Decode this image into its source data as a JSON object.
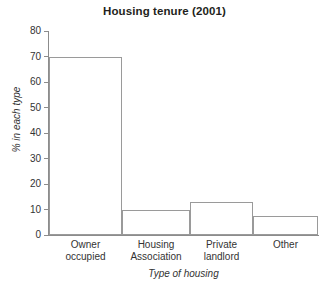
{
  "chart_data": {
    "type": "bar",
    "title": "Housing tenure (2001)",
    "xlabel": "Type of housing",
    "ylabel": "% in each type",
    "categories": [
      "Owner occupied",
      "Housing Association",
      "Private landlord",
      "Other"
    ],
    "category_lines": [
      [
        "Owner",
        "occupied"
      ],
      [
        "Housing",
        "Association"
      ],
      [
        "Private",
        "landlord"
      ],
      [
        "Other"
      ]
    ],
    "values": [
      70,
      10,
      13,
      7.5
    ],
    "ylim": [
      0,
      80
    ],
    "yticks": [
      0,
      10,
      20,
      30,
      40,
      50,
      60,
      70,
      80
    ],
    "ytick_labels": [
      "0",
      "10",
      "20",
      "30",
      "40",
      "50",
      "60",
      "70",
      "80"
    ],
    "grid": false,
    "legend": false,
    "bar_fill_color": "#ffffff",
    "bar_border_color": "#9a9a9a",
    "axis_color": "#8c8c8c",
    "text_color": "#333333",
    "title_color": "#231f20",
    "background_color": "#ffffff"
  }
}
